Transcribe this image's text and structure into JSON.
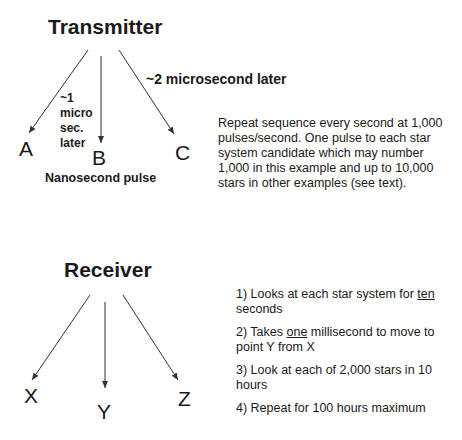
{
  "transmitter": {
    "title": "Transmitter",
    "targets": [
      "A",
      "B",
      "C"
    ],
    "delay_label_1": [
      "~1",
      "micro",
      "sec.",
      "later"
    ],
    "delay_label_2": "~2 microsecond later",
    "pulse_label": "Nanosecond pulse",
    "description": "Repeat sequence every second at 1,000 pulses/second. One pulse to each star system candidate which may number 1,000 in this example and up to 10,000 stars in other examples (see text)."
  },
  "receiver": {
    "title": "Receiver",
    "targets": [
      "X",
      "Y",
      "Z"
    ],
    "steps": [
      {
        "prefix": "1) Looks at each star system for ",
        "emph": "ten",
        "suffix": " seconds"
      },
      {
        "prefix": "2) Takes ",
        "emph": "one",
        "suffix": " millisecond to move to point Y from X"
      },
      {
        "prefix": "3) Look at each of 2,000 stars in 10 hours",
        "emph": "",
        "suffix": ""
      },
      {
        "prefix": "4) Repeat for 100 hours maximum",
        "emph": "",
        "suffix": ""
      }
    ]
  },
  "colors": {
    "text": "#1a1a1a",
    "arrow": "#333333",
    "background": "#ffffff"
  }
}
